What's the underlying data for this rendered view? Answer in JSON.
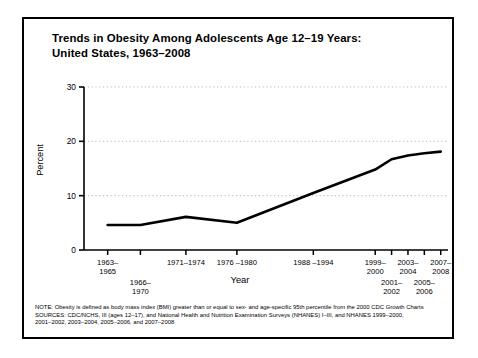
{
  "figure": {
    "title_line1": "Trends in Obesity Among Adolescents Age 12–19 Years:",
    "title_line2": "United States, 1963–2008",
    "border_color": "#000000",
    "background_color": "#ffffff"
  },
  "chart_data": {
    "type": "line",
    "title": "Trends in Obesity Among Adolescents Age 12–19 Years: United States, 1963–2008",
    "xlabel": "Year",
    "ylabel": "Percent",
    "ylim": [
      0,
      30
    ],
    "yticks": [
      0,
      10,
      20,
      30
    ],
    "ytick_labels": [
      "0",
      "10",
      "20",
      "30"
    ],
    "grid": "horizontal-dotted",
    "legend": "none",
    "line_color": "#000000",
    "categories": [
      "1963–1965",
      "1966–1970",
      "1971–1974",
      "1976–1980",
      "1988–1994",
      "1999–2000",
      "2001–2002",
      "2003–2004",
      "2005–2006",
      "2007–2008"
    ],
    "values": [
      4.6,
      4.6,
      6.1,
      5.0,
      10.5,
      14.8,
      16.7,
      17.4,
      17.8,
      18.1
    ],
    "series": [
      {
        "name": "Obesity prevalence, ages 12–19",
        "values": [
          4.6,
          4.6,
          6.1,
          5.0,
          10.5,
          14.8,
          16.7,
          17.4,
          17.8,
          18.1
        ]
      }
    ],
    "xtick_positions_pct": [
      6.5,
      15.5,
      28.0,
      42.0,
      63.0,
      80.0,
      84.5,
      89.0,
      93.5,
      98.0
    ]
  },
  "axis": {
    "x_labels": [
      {
        "text": "1963–\n1965",
        "left_pct": 6.5,
        "row": 0
      },
      {
        "text": "1966–\n1970",
        "left_pct": 15.5,
        "row": 1
      },
      {
        "text": "1971–1974",
        "left_pct": 28.0,
        "row": 0
      },
      {
        "text": "1976 –1980",
        "left_pct": 42.0,
        "row": 0
      },
      {
        "text": "1988 –1994",
        "left_pct": 63.0,
        "row": 0
      },
      {
        "text": "1999–\n2000",
        "left_pct": 80.0,
        "row": 0
      },
      {
        "text": "2001–\n2002",
        "left_pct": 84.5,
        "row": 1
      },
      {
        "text": "2003–\n2004",
        "left_pct": 89.0,
        "row": 0
      },
      {
        "text": "2005–\n2006",
        "left_pct": 93.5,
        "row": 1
      },
      {
        "text": "2007–\n2008",
        "left_pct": 98.0,
        "row": 0
      }
    ],
    "x_title": "Year",
    "y_title": "Percent"
  },
  "notes": {
    "note": "NOTE: Obesity is defined as body mass index (BMI) greater than or equal to sex- and age-specific 95th percentile from the 2000 CDC Growth Charts",
    "sources_line1": "SOURCES: CDC/NCHS, III (ages 12–17), and National Health and Nutrition Examination Surveys (NHANES) I–III, and NHANES 1999–2000,",
    "sources_line2": "2001–2002, 2003–2004, 2005–2006, and 2007–2008"
  }
}
